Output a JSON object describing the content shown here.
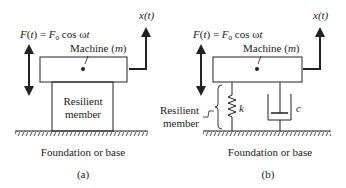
{
  "panels": [
    {
      "id": "a",
      "force_label": "F(t) = F",
      "force_sub": "0",
      "force_tail": " cos ωt",
      "machine_label": "Machine (",
      "machine_m": "m",
      "machine_close": ")",
      "displacement_label": "x(t)",
      "member_line1": "Resilient",
      "member_line2": "member",
      "foundation_label": "Foundation or base",
      "caption": "(a)"
    },
    {
      "id": "b",
      "force_label": "F(t) = F",
      "force_sub": "0",
      "force_tail": " cos ωt",
      "machine_label": "Machine (",
      "machine_m": "m",
      "machine_close": ")",
      "displacement_label": "x(t)",
      "member_line1": "Resilient",
      "member_line2": "member",
      "spring_label": "k",
      "damper_label": "c",
      "foundation_label": "Foundation or base",
      "caption": "(b)"
    }
  ],
  "colors": {
    "ink": "#222222",
    "background": "#ffffff"
  }
}
